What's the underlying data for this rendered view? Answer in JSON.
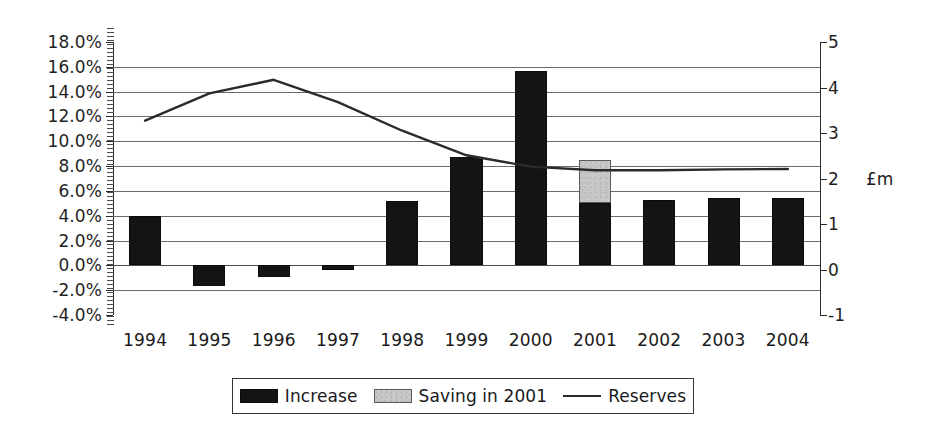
{
  "chart_data": {
    "type": "bar",
    "title": "",
    "subtitle": "",
    "xlabel": "",
    "ylabel": "",
    "ylabel_secondary": "£m",
    "categories": [
      "1994",
      "1995",
      "1996",
      "1997",
      "1998",
      "1999",
      "2000",
      "2001",
      "2002",
      "2003",
      "2004"
    ],
    "yaxis_left": {
      "ticks": [
        "18.0%",
        "16.0%",
        "14.0%",
        "12.0%",
        "10.0%",
        "8.0%",
        "6.0%",
        "4.0%",
        "2.0%",
        "0.0%",
        "-2.0%",
        "-4.0%"
      ],
      "tick_values": [
        18.0,
        16.0,
        14.0,
        12.0,
        10.0,
        8.0,
        6.0,
        4.0,
        2.0,
        0.0,
        -2.0,
        -4.0
      ],
      "ylim": [
        -4.0,
        18.0
      ],
      "unit": "%"
    },
    "yaxis_right": {
      "ticks": [
        "5",
        "4",
        "3",
        "2",
        "1",
        "0",
        "-1"
      ],
      "tick_values": [
        5,
        4,
        3,
        2,
        1,
        0,
        -1
      ],
      "ylim": [
        -1,
        5
      ],
      "unit": "£m",
      "unit_label": "£m",
      "unit_label_at_value": 2
    },
    "grid": true,
    "legend_position": "bottom",
    "series": [
      {
        "name": "Increase",
        "type": "bar",
        "axis": "left",
        "color": "#141414",
        "values": [
          4.0,
          -1.7,
          -0.9,
          -0.4,
          5.2,
          8.7,
          15.7,
          5.0,
          5.3,
          5.4,
          5.4
        ]
      },
      {
        "name": "Saving in 2001",
        "type": "bar-stacked",
        "axis": "left",
        "color": "#c8c8c8",
        "values": [
          null,
          null,
          null,
          null,
          null,
          null,
          null,
          3.5,
          null,
          null,
          null
        ],
        "stack_base": [
          null,
          null,
          null,
          null,
          null,
          null,
          null,
          5.0,
          null,
          null,
          null
        ],
        "stack_top": [
          null,
          null,
          null,
          null,
          null,
          null,
          null,
          8.5,
          null,
          null,
          null
        ]
      },
      {
        "name": "Reserves",
        "type": "line",
        "axis": "right",
        "color": "#2a2a2a",
        "values_percent_scale": [
          12.0,
          14.2,
          15.3,
          13.5,
          11.2,
          9.2,
          8.3,
          8.0,
          8.0,
          8.05,
          8.1
        ],
        "values": [
          3.27,
          3.87,
          4.17,
          3.68,
          3.05,
          2.51,
          2.26,
          2.18,
          2.18,
          2.2,
          2.21
        ]
      }
    ],
    "legend": [
      {
        "label": "Increase",
        "marker": "black-swatch"
      },
      {
        "label": "Saving in 2001",
        "marker": "gray-swatch"
      },
      {
        "label": "Reserves",
        "marker": "line-swatch"
      }
    ]
  }
}
